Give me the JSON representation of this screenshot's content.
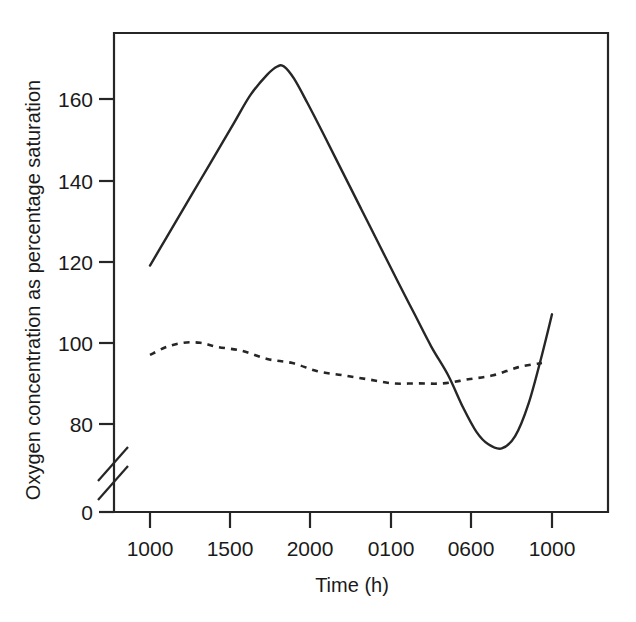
{
  "chart_data": {
    "type": "line",
    "title": "",
    "xlabel": "Time (h)",
    "ylabel": "Oxygen concentration as percentage saturation",
    "grid": false,
    "legend": "none",
    "axis_break": "y-axis broken between 0 and 80",
    "x_tick_labels": [
      "1000",
      "1500",
      "2000",
      "0100",
      "0600",
      "1000"
    ],
    "x_tick_hours": [
      10,
      15,
      20,
      25,
      30,
      34
    ],
    "y_tick_labels": [
      "0",
      "80",
      "100",
      "120",
      "140",
      "160"
    ],
    "y_tick_values": [
      0,
      80,
      100,
      120,
      140,
      160
    ],
    "ylim": [
      80,
      180
    ],
    "xlim": [
      10,
      34
    ],
    "series": [
      {
        "name": "solid-curve",
        "style": "solid",
        "x": [
          10.0,
          11.0,
          12.0,
          13.0,
          14.0,
          15.0,
          16.0,
          17.0,
          17.6,
          18.0,
          18.6,
          19.4,
          20.4,
          21.5,
          22.6,
          23.7,
          24.8,
          25.8,
          26.8,
          27.8,
          28.7,
          29.5,
          30.2,
          31.0,
          31.8,
          32.6,
          33.4,
          34.0
        ],
        "values": [
          119,
          126,
          133,
          140,
          147,
          154,
          161,
          166,
          168,
          168,
          165,
          159,
          151,
          142,
          133,
          124,
          115,
          107,
          99,
          92,
          84,
          78,
          75,
          74,
          77,
          85,
          97,
          107
        ]
      },
      {
        "name": "dashed-curve",
        "style": "dashed",
        "x": [
          10.0,
          11.0,
          12.0,
          13.0,
          14.0,
          15.5,
          17.0,
          18.5,
          20.0,
          21.5,
          23.0,
          24.5,
          26.0,
          27.5,
          29.0,
          30.5,
          32.0,
          33.4
        ],
        "values": [
          97,
          99,
          100,
          100,
          99,
          98,
          96,
          95,
          93,
          92,
          91,
          90,
          90,
          90,
          91,
          92,
          94,
          95
        ]
      }
    ]
  }
}
